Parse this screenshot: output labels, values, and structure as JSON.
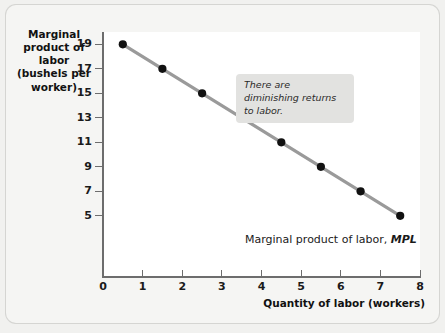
{
  "chart_data": {
    "type": "line",
    "title": "",
    "xlabel": "Quantity of labor (workers)",
    "ylabel": "Marginal product of labor (bushels per worker)",
    "ylabel_lines": [
      "Marginal",
      "product of labor",
      "(bushels per",
      "worker)"
    ],
    "series": [
      {
        "name": "Marginal product of labor, MPL",
        "x": [
          0.5,
          1.5,
          2.5,
          3.5,
          4.5,
          5.5,
          6.5,
          7.5
        ],
        "values": [
          19,
          17,
          15,
          13,
          11,
          9,
          7,
          5
        ]
      }
    ],
    "xlim": [
      0,
      8
    ],
    "ylim": [
      0,
      20
    ],
    "xticks": [
      "0",
      "1",
      "2",
      "3",
      "4",
      "5",
      "6",
      "7",
      "8"
    ],
    "xtick_values": [
      0,
      1,
      2,
      3,
      4,
      5,
      6,
      7,
      8
    ],
    "yticks": [
      "19",
      "17",
      "15",
      "13",
      "11",
      "9",
      "7",
      "5"
    ],
    "ytick_values": [
      19,
      17,
      15,
      13,
      11,
      9,
      7,
      5
    ],
    "grid": false,
    "legend_position": "inline-right",
    "annotations": [
      {
        "text": "There are diminishing returns to labor.",
        "x": 4.3,
        "y": 17.4
      }
    ],
    "series_inline_label": {
      "prefix": "Marginal product of labor, ",
      "symbol": "MPL"
    },
    "colors": {
      "line": "#9a9a9a",
      "marker": "#111111",
      "axis": "#6d6d6d",
      "plot_background": "#ffffff",
      "figure_background": "#f1f1ef",
      "annotation_background": "#e2e2e0",
      "text": "#1a1a1a"
    }
  }
}
